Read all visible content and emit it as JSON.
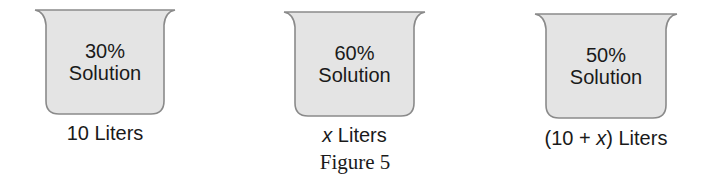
{
  "figure": {
    "caption": "Figure 5",
    "fill_color": "#e4e4e4",
    "outline_color": "#8a8a8a",
    "beakers": [
      {
        "percent": "30%",
        "label": "Solution",
        "volume_prefix": "",
        "volume_var": "",
        "volume_suffix": "10 Liters"
      },
      {
        "percent": "60%",
        "label": "Solution",
        "volume_prefix": "",
        "volume_var": "x",
        "volume_suffix": " Liters"
      },
      {
        "percent": "50%",
        "label": "Solution",
        "volume_prefix": "(10 + ",
        "volume_var": "x",
        "volume_suffix": ") Liters"
      }
    ]
  }
}
